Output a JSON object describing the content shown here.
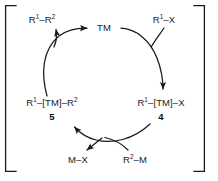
{
  "diagram": {
    "background_color": "#ffffff",
    "stroke_color": "#1a1a1a",
    "bracket": {
      "name": "square-brackets",
      "left_x": 5,
      "right_x": 205,
      "top_y": 5,
      "bottom_y": 172,
      "foot_length": 11
    },
    "catalyst": {
      "label": "TM",
      "x": 104,
      "y": 28
    },
    "nodes": [
      {
        "id": "product",
        "label_html": "R<sup>1</sup>–R<sup>2</sup>",
        "label_text": "R1-R2",
        "x": 42,
        "y": 20
      },
      {
        "id": "substrate-halide",
        "label_html": "R<sup>1</sup>–X",
        "label_text": "R1-X",
        "x": 164,
        "y": 20
      },
      {
        "id": "complex-5",
        "label_html": "R<sup>1</sup>–[TM]–R<sup>2</sup>",
        "label_text": "R1-[TM]-R2",
        "x": 52,
        "y": 103,
        "number": "5",
        "number_x": 52,
        "number_y": 117
      },
      {
        "id": "complex-4",
        "label_html": "R<sup>1</sup>–[TM]–X",
        "label_text": "R1-[TM]-X",
        "x": 161,
        "y": 103,
        "number": "4",
        "number_x": 161,
        "number_y": 117
      },
      {
        "id": "metal-halide-byproduct",
        "label_html": "M–X",
        "label_text": "M-X",
        "x": 78,
        "y": 160
      },
      {
        "id": "organometallic-reagent",
        "label_html": "R<sup>2</sup>–M",
        "label_text": "R2-M",
        "x": 135,
        "y": 160
      }
    ],
    "arrows": [
      {
        "id": "reductive-elimination-arc",
        "from": "complex-5",
        "to": "catalyst-TM",
        "description": "left arc from R1-[TM]-R2 upward to TM"
      },
      {
        "id": "product-release-branch",
        "from": "reductive-elimination-arc",
        "to": "product",
        "description": "branch arrow releasing R1-R2"
      },
      {
        "id": "oxidative-addition-arc",
        "from": "catalyst-TM",
        "to": "complex-4",
        "description": "right arc from TM down to R1-[TM]-X"
      },
      {
        "id": "halide-feed-branch",
        "from": "substrate-halide",
        "to": "oxidative-addition-arc",
        "description": "feeder line from R1-X into the arc"
      },
      {
        "id": "transmetalation-arc",
        "from": "complex-4",
        "to": "complex-5",
        "description": "bottom arc from R1-[TM]-X to R1-[TM]-R2"
      },
      {
        "id": "reagent-feed-branch",
        "from": "organometallic-reagent",
        "to": "transmetalation-arc",
        "description": "feeder line from R2-M into the bottom arc"
      },
      {
        "id": "byproduct-release-branch",
        "from": "transmetalation-arc",
        "to": "metal-halide-byproduct",
        "description": "branch arrow releasing M-X"
      }
    ]
  }
}
